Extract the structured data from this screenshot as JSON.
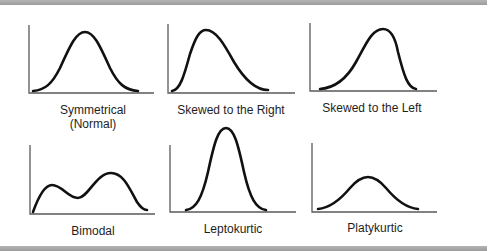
{
  "figure": {
    "panels": [
      {
        "id": "symmetrical",
        "label_line1": "Symmetrical",
        "label_line2": "(Normal)"
      },
      {
        "id": "skewed-right",
        "label_line1": "Skewed to the Right"
      },
      {
        "id": "skewed-left",
        "label_line1": "Skewed to the Left"
      },
      {
        "id": "bimodal",
        "label_line1": "Bimodal"
      },
      {
        "id": "leptokurtic",
        "label_line1": "Leptokurtic"
      },
      {
        "id": "platykurtic",
        "label_line1": "Platykurtic"
      }
    ],
    "colors": {
      "curve": "#111111",
      "axis": "#555555",
      "rule": "#a8a8a8"
    }
  }
}
